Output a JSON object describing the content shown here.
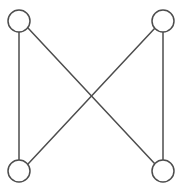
{
  "figure": {
    "name": "utility-graph-k22-crossing",
    "width": 181,
    "height": 189,
    "background_color": "#ffffff",
    "stroke_color": "#4d4d4d",
    "node_fill_color": "#ffffff",
    "node_stroke_width": 1.5,
    "edge_stroke_width": 1.5
  },
  "nodes": [
    {
      "id": "top-left",
      "label": "",
      "cx": 19,
      "cy": 21,
      "r": 11
    },
    {
      "id": "top-right",
      "label": "",
      "cx": 163,
      "cy": 21,
      "r": 11
    },
    {
      "id": "bottom-left",
      "label": "",
      "cx": 19,
      "cy": 171,
      "r": 11
    },
    {
      "id": "bottom-right",
      "label": "",
      "cx": 163,
      "cy": 171,
      "r": 11
    }
  ],
  "edges": [
    {
      "id": "edge-left-vertical",
      "from": "top-left",
      "to": "bottom-left",
      "x1": 19,
      "y1": 32,
      "x2": 19,
      "y2": 160
    },
    {
      "id": "edge-right-vertical",
      "from": "top-right",
      "to": "bottom-right",
      "x1": 163,
      "y1": 32,
      "x2": 163,
      "y2": 160
    },
    {
      "id": "edge-diagonal-tl-br",
      "from": "top-left",
      "to": "bottom-right",
      "x1": 28,
      "y1": 28,
      "x2": 155,
      "y2": 164
    },
    {
      "id": "edge-diagonal-tr-bl",
      "from": "top-right",
      "to": "bottom-left",
      "x1": 155,
      "y1": 28,
      "x2": 28,
      "y2": 164
    }
  ],
  "crossing_point": {
    "x": 91,
    "y": 96
  }
}
